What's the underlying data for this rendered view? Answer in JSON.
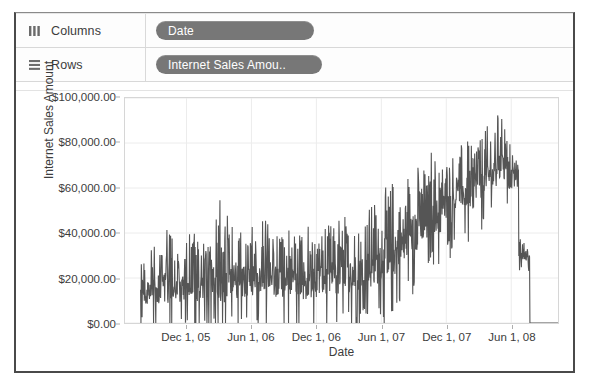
{
  "shelves": [
    {
      "icon": "columns-bars-icon",
      "label": "Columns",
      "pill": "Date"
    },
    {
      "icon": "rows-lines-icon",
      "label": "Rows",
      "pill": "Internet Sales Amou.."
    }
  ],
  "chart_data": {
    "type": "line",
    "title": "",
    "xlabel": "Date",
    "ylabel": "Internet Sales Amount",
    "grid": true,
    "legend": false,
    "line_color": "#555555",
    "ylim": [
      0,
      100000
    ],
    "ytick_labels": [
      "$100,000.00",
      "$80,000.00",
      "$60,000.00",
      "$40,000.00",
      "$20,000.00",
      "$0.00"
    ],
    "ytick_values": [
      100000,
      80000,
      60000,
      40000,
      20000,
      0
    ],
    "xtick_labels": [
      "Dec 1, 05",
      "Jun 1, 06",
      "Dec 1, 06",
      "Jun 1, 07",
      "Dec 1, 07",
      "Jun 1, 08"
    ],
    "xtick_positions": [
      0.142,
      0.292,
      0.442,
      0.592,
      0.742,
      0.892
    ],
    "x_range": [
      "Jul 1, 05",
      "Aug 1, 08"
    ],
    "series": [
      {
        "name": "Internet Sales Amount",
        "note": "Daily internet sales; baseline ~15k rising to ~60k, peak ~95k in mid 2008, then drops to 0 at the end of the range.",
        "monthly_mean": [
          14000,
          15000,
          16000,
          15500,
          17000,
          16000,
          18000,
          17500,
          19000,
          18000,
          20000,
          19500,
          19000,
          18000,
          17500,
          18500,
          19000,
          20000,
          21000,
          22000,
          24000,
          26000,
          30000,
          34000,
          40000,
          44000,
          48000,
          52000,
          55000,
          58000,
          62000,
          66000,
          70000,
          64000,
          30000,
          0
        ],
        "monthly_max": [
          34000,
          40000,
          42000,
          38000,
          44000,
          41000,
          46000,
          55000,
          48000,
          44000,
          48000,
          49000,
          47000,
          44000,
          43000,
          45000,
          47000,
          48000,
          50000,
          52000,
          55000,
          58000,
          62000,
          66000,
          72000,
          70000,
          76000,
          80000,
          79000,
          84000,
          86000,
          88000,
          95000,
          80000,
          38000,
          0
        ],
        "peak_value": 95000,
        "end_value": 0
      }
    ]
  }
}
